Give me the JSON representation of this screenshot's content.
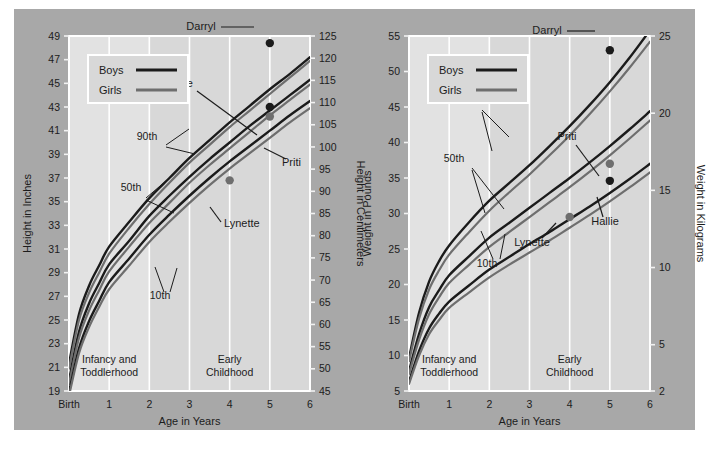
{
  "figure": {
    "panel_color": "#a8a8a8",
    "plot_bg_early": "#d8d8d8",
    "plot_bg_infancy": "#e2e2e2",
    "boys_color": "#1b1b1b",
    "girls_color": "#6e6e6e",
    "grid_color": "#ffffff"
  },
  "charts": [
    {
      "id": "height-chart",
      "legend": {
        "boys": "Boys",
        "girls": "Girls"
      },
      "x_axis": {
        "title": "Age in Years",
        "ticks": [
          "Birth",
          "1",
          "2",
          "3",
          "4",
          "5",
          "6"
        ],
        "values": [
          0,
          1,
          2,
          3,
          4,
          5,
          6
        ]
      },
      "y_axis_left": {
        "title": "Height in Inches",
        "ticks": [
          "19",
          "21",
          "23",
          "25",
          "27",
          "29",
          "31",
          "33",
          "35",
          "37",
          "39",
          "41",
          "43",
          "45",
          "47",
          "49"
        ],
        "values": [
          19,
          21,
          23,
          25,
          27,
          29,
          31,
          33,
          35,
          37,
          39,
          41,
          43,
          45,
          47,
          49
        ]
      },
      "y_axis_right": {
        "title": "Height in Centimeters",
        "ticks": [
          "45",
          "50",
          "55",
          "60",
          "65",
          "70",
          "75",
          "80",
          "85",
          "90",
          "95",
          "100",
          "105",
          "110",
          "115",
          "120",
          "125"
        ],
        "values": [
          45,
          50,
          55,
          60,
          65,
          70,
          75,
          80,
          85,
          90,
          95,
          100,
          105,
          110,
          115,
          120,
          125
        ]
      },
      "zones": [
        {
          "label": "Infancy and Toddlerhood",
          "from": 0,
          "to": 2
        },
        {
          "label": "Early Childhood",
          "from": 2,
          "to": 6
        }
      ],
      "percentile_labels": [
        "90th",
        "50th",
        "10th"
      ],
      "children": [
        {
          "name": "Darryl",
          "sex": "boy",
          "age": 5.0,
          "value": 48.4
        },
        {
          "name": "Hallie",
          "sex": "boy",
          "age": 5.0,
          "value": 43.0
        },
        {
          "name": "Priti",
          "sex": "girl",
          "age": 5.0,
          "value": 42.2
        },
        {
          "name": "Lynette",
          "sex": "girl",
          "age": 4.0,
          "value": 36.8
        }
      ]
    },
    {
      "id": "weight-chart",
      "legend": {
        "boys": "Boys",
        "girls": "Girls"
      },
      "x_axis": {
        "title": "Age in Years",
        "ticks": [
          "Birth",
          "1",
          "2",
          "3",
          "4",
          "5",
          "6"
        ],
        "values": [
          0,
          1,
          2,
          3,
          4,
          5,
          6
        ]
      },
      "y_axis_left": {
        "title": "Weight in Pounds",
        "ticks": [
          "5",
          "10",
          "15",
          "20",
          "25",
          "30",
          "35",
          "40",
          "45",
          "50",
          "55"
        ],
        "values": [
          5,
          10,
          15,
          20,
          25,
          30,
          35,
          40,
          45,
          50,
          55
        ]
      },
      "y_axis_right": {
        "title": "Weight in Kilograms",
        "ticks": [
          "2",
          "5",
          "10",
          "15",
          "20",
          "25"
        ],
        "values": [
          2,
          5,
          10,
          15,
          20,
          25
        ]
      },
      "zones": [
        {
          "label": "Infancy and Toddlerhood",
          "from": 0,
          "to": 2
        },
        {
          "label": "Early Childhood",
          "from": 2,
          "to": 6
        }
      ],
      "percentile_labels": [
        "90th",
        "50th",
        "10th"
      ],
      "children": [
        {
          "name": "Darryl",
          "sex": "boy",
          "age": 5.0,
          "value": 53.0
        },
        {
          "name": "Priti",
          "sex": "girl",
          "age": 5.0,
          "value": 37.0
        },
        {
          "name": "Hallie",
          "sex": "boy",
          "age": 5.0,
          "value": 34.6
        },
        {
          "name": "Lynette",
          "sex": "girl",
          "age": 4.0,
          "value": 29.5
        }
      ]
    }
  ],
  "chart_data": [
    {
      "type": "line",
      "title": "Height growth percentiles, birth to 6 years",
      "xlabel": "Age in Years",
      "ylabel": "Height in Inches",
      "ylabel_secondary": "Height in Centimeters",
      "xlim": [
        0,
        6
      ],
      "ylim": [
        19,
        49
      ],
      "ylim_secondary": [
        45,
        125
      ],
      "grid": true,
      "legend": [
        "Boys",
        "Girls"
      ],
      "legend_position": "top-left",
      "x": [
        0,
        0.25,
        0.5,
        0.75,
        1,
        1.5,
        2,
        2.5,
        3,
        3.5,
        4,
        4.5,
        5,
        5.5,
        6
      ],
      "series": [
        {
          "name": "Boys 90th",
          "sex": "boy",
          "percentile": 90,
          "values": [
            21.3,
            25.5,
            27.9,
            29.6,
            31.2,
            33.3,
            35.3,
            37.0,
            38.7,
            40.2,
            41.7,
            43.1,
            44.5,
            45.8,
            47.2
          ]
        },
        {
          "name": "Girls 90th",
          "sex": "girl",
          "percentile": 90,
          "values": [
            20.9,
            25.0,
            27.3,
            29.0,
            30.6,
            32.8,
            34.8,
            36.6,
            38.3,
            39.8,
            41.3,
            42.7,
            44.1,
            45.5,
            46.9
          ]
        },
        {
          "name": "Boys 50th",
          "sex": "boy",
          "percentile": 50,
          "values": [
            19.9,
            24.0,
            26.4,
            28.1,
            29.7,
            31.7,
            33.8,
            35.5,
            37.1,
            38.6,
            40.0,
            41.4,
            42.7,
            44.0,
            45.3
          ]
        },
        {
          "name": "Girls 50th",
          "sex": "girl",
          "percentile": 50,
          "values": [
            19.6,
            23.5,
            25.8,
            27.5,
            29.1,
            31.2,
            33.2,
            34.9,
            36.6,
            38.1,
            39.5,
            40.9,
            42.3,
            43.6,
            44.9
          ]
        },
        {
          "name": "Boys 10th",
          "sex": "boy",
          "percentile": 10,
          "values": [
            18.9,
            22.6,
            24.9,
            26.6,
            28.2,
            30.2,
            32.2,
            33.9,
            35.5,
            37.0,
            38.4,
            39.7,
            41.0,
            42.3,
            43.5
          ]
        },
        {
          "name": "Girls 10th",
          "sex": "girl",
          "percentile": 10,
          "values": [
            18.6,
            22.2,
            24.4,
            26.1,
            27.6,
            29.6,
            31.6,
            33.3,
            34.9,
            36.4,
            37.8,
            39.1,
            40.4,
            41.7,
            42.9
          ]
        }
      ],
      "annotations": [
        {
          "text": "90th",
          "type": "percentile"
        },
        {
          "text": "50th",
          "type": "percentile"
        },
        {
          "text": "10th",
          "type": "percentile"
        },
        {
          "text": "Infancy and Toddlerhood",
          "type": "zone"
        },
        {
          "text": "Early Childhood",
          "type": "zone"
        }
      ],
      "points": [
        {
          "label": "Darryl",
          "x": 5.0,
          "y": 48.4,
          "sex": "boy"
        },
        {
          "label": "Hallie",
          "x": 5.0,
          "y": 43.0,
          "sex": "boy"
        },
        {
          "label": "Priti",
          "x": 5.0,
          "y": 42.2,
          "sex": "girl"
        },
        {
          "label": "Lynette",
          "x": 4.0,
          "y": 36.8,
          "sex": "girl"
        }
      ]
    },
    {
      "type": "line",
      "title": "Weight growth percentiles, birth to 6 years",
      "xlabel": "Age in Years",
      "ylabel": "Weight in Pounds",
      "ylabel_secondary": "Weight in Kilograms",
      "xlim": [
        0,
        6
      ],
      "ylim": [
        5,
        55
      ],
      "ylim_secondary": [
        2,
        25
      ],
      "grid": true,
      "legend": [
        "Boys",
        "Girls"
      ],
      "legend_position": "top-left",
      "x": [
        0,
        0.25,
        0.5,
        0.75,
        1,
        1.5,
        2,
        2.5,
        3,
        3.5,
        4,
        4.5,
        5,
        5.5,
        6
      ],
      "series": [
        {
          "name": "Boys 90th",
          "sex": "boy",
          "percentile": 90,
          "values": [
            9.6,
            16.0,
            20.4,
            23.3,
            25.5,
            28.8,
            31.8,
            34.3,
            36.8,
            39.5,
            42.3,
            45.3,
            48.5,
            52.0,
            55.8
          ]
        },
        {
          "name": "Girls 90th",
          "sex": "girl",
          "percentile": 90,
          "values": [
            9.2,
            15.2,
            19.3,
            22.0,
            24.2,
            27.4,
            30.4,
            33.0,
            35.5,
            38.2,
            41.0,
            44.0,
            47.2,
            50.6,
            54.2
          ]
        },
        {
          "name": "Boys 50th",
          "sex": "boy",
          "percentile": 50,
          "values": [
            7.8,
            13.0,
            16.8,
            19.2,
            21.3,
            24.0,
            26.6,
            28.7,
            30.8,
            32.9,
            35.0,
            37.2,
            39.5,
            41.9,
            44.4
          ]
        },
        {
          "name": "Girls 50th",
          "sex": "girl",
          "percentile": 50,
          "values": [
            7.4,
            12.2,
            15.8,
            18.2,
            20.2,
            22.8,
            25.3,
            27.4,
            29.5,
            31.6,
            33.7,
            35.9,
            38.2,
            40.6,
            43.1
          ]
        },
        {
          "name": "Boys 10th",
          "sex": "boy",
          "percentile": 10,
          "values": [
            6.3,
            10.6,
            13.8,
            15.9,
            17.6,
            19.9,
            22.1,
            23.9,
            25.7,
            27.4,
            29.2,
            31.0,
            32.9,
            34.9,
            37.0
          ]
        },
        {
          "name": "Girls 10th",
          "sex": "girl",
          "percentile": 10,
          "values": [
            6.0,
            10.0,
            13.0,
            15.0,
            16.7,
            18.9,
            21.0,
            22.8,
            24.5,
            26.2,
            28.0,
            29.8,
            31.7,
            33.7,
            35.8
          ]
        }
      ],
      "annotations": [
        {
          "text": "90th",
          "type": "percentile"
        },
        {
          "text": "50th",
          "type": "percentile"
        },
        {
          "text": "10th",
          "type": "percentile"
        },
        {
          "text": "Infancy and Toddlerhood",
          "type": "zone"
        },
        {
          "text": "Early Childhood",
          "type": "zone"
        }
      ],
      "points": [
        {
          "label": "Darryl",
          "x": 5.0,
          "y": 53.0,
          "sex": "boy"
        },
        {
          "label": "Priti",
          "x": 5.0,
          "y": 37.0,
          "sex": "girl"
        },
        {
          "label": "Hallie",
          "x": 5.0,
          "y": 34.6,
          "sex": "boy"
        },
        {
          "label": "Lynette",
          "x": 4.0,
          "y": 29.5,
          "sex": "girl"
        }
      ]
    }
  ]
}
